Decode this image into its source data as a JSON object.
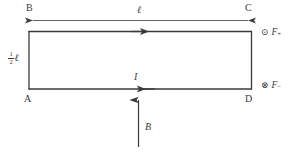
{
  "figure": {
    "background_color": "#ffffff",
    "line_color": "#3a3a3a",
    "text_color": "#3a3a3a"
  },
  "vertices": {
    "top_left": "B",
    "top_right": "C",
    "bottom_left": "A",
    "bottom_right": "D"
  },
  "dimensions": {
    "width_label": "ℓ",
    "height_numerator": "1",
    "height_denominator": "2",
    "height_unit": "ℓ"
  },
  "current": {
    "label": "I",
    "top_edge_direction": "right",
    "bottom_edge_direction": "left"
  },
  "field": {
    "label": "B",
    "direction": "up"
  },
  "forces": [
    {
      "symbol": "⊙",
      "symbol_name": "dot-in-circle-out-of-page",
      "label": "F",
      "subscript": "+",
      "position": "top-right"
    },
    {
      "symbol": "⊗",
      "symbol_name": "cross-in-circle-into-page",
      "label": "F",
      "subscript": "−",
      "position": "bottom-right"
    }
  ]
}
